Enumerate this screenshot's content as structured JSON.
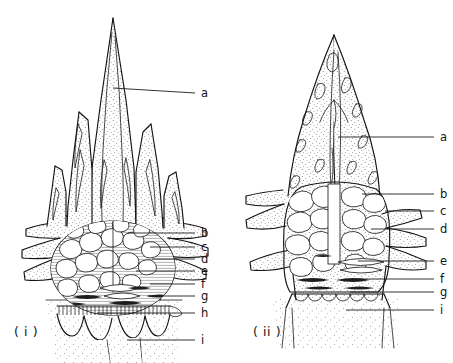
{
  "figure": {
    "background_color": "#ffffff",
    "ink_color": "#141414",
    "panels": [
      {
        "id": "panel-i",
        "caption": "( i )",
        "caption_x": 14,
        "caption_y": 336,
        "labels": [
          {
            "key": "a",
            "text": "a",
            "label_x": 201,
            "label_y": 93,
            "leader_x1": 113,
            "leader_y1": 88,
            "leader_x2": 195,
            "leader_y2": 93
          },
          {
            "key": "b",
            "text": "b",
            "label_x": 201,
            "label_y": 233,
            "leader_x1": 128,
            "leader_y1": 233,
            "leader_x2": 195,
            "leader_y2": 233
          },
          {
            "key": "c",
            "text": "c",
            "label_x": 201,
            "label_y": 247,
            "leader_x1": 150,
            "leader_y1": 247,
            "leader_x2": 195,
            "leader_y2": 247
          },
          {
            "key": "d",
            "text": "d",
            "label_x": 201,
            "label_y": 259,
            "leader_x1": 152,
            "leader_y1": 259,
            "leader_x2": 195,
            "leader_y2": 259
          },
          {
            "key": "e",
            "text": "e",
            "label_x": 201,
            "label_y": 271,
            "leader_x1": 136,
            "leader_y1": 271,
            "leader_x2": 195,
            "leader_y2": 271
          },
          {
            "key": "f",
            "text": "f",
            "label_x": 201,
            "label_y": 284,
            "leader_x1": 150,
            "leader_y1": 284,
            "leader_x2": 195,
            "leader_y2": 284
          },
          {
            "key": "g",
            "text": "g",
            "label_x": 201,
            "label_y": 296,
            "leader_x1": 148,
            "leader_y1": 296,
            "leader_x2": 195,
            "leader_y2": 296
          },
          {
            "key": "h",
            "text": "h",
            "label_x": 201,
            "label_y": 313,
            "leader_x1": 97,
            "leader_y1": 313,
            "leader_x2": 195,
            "leader_y2": 313
          },
          {
            "key": "i",
            "text": "i",
            "label_x": 201,
            "label_y": 340,
            "leader_x1": 127,
            "leader_y1": 340,
            "leader_x2": 195,
            "leader_y2": 340
          }
        ]
      },
      {
        "id": "panel-ii",
        "caption": "( ii )",
        "caption_x": 253,
        "caption_y": 336,
        "labels": [
          {
            "key": "a",
            "text": "a",
            "label_x": 440,
            "label_y": 137,
            "leader_x1": 338,
            "leader_y1": 137,
            "leader_x2": 434,
            "leader_y2": 137
          },
          {
            "key": "b",
            "text": "b",
            "label_x": 440,
            "label_y": 194,
            "leader_x1": 362,
            "leader_y1": 194,
            "leader_x2": 434,
            "leader_y2": 194
          },
          {
            "key": "c",
            "text": "c",
            "label_x": 440,
            "label_y": 211,
            "leader_x1": 385,
            "leader_y1": 211,
            "leader_x2": 434,
            "leader_y2": 211
          },
          {
            "key": "d",
            "text": "d",
            "label_x": 440,
            "label_y": 229,
            "leader_x1": 371,
            "leader_y1": 229,
            "leader_x2": 434,
            "leader_y2": 229
          },
          {
            "key": "e",
            "text": "e",
            "label_x": 440,
            "label_y": 261,
            "leader_x1": 358,
            "leader_y1": 261,
            "leader_x2": 434,
            "leader_y2": 261
          },
          {
            "key": "f",
            "text": "f",
            "label_x": 440,
            "label_y": 279,
            "leader_x1": 356,
            "leader_y1": 279,
            "leader_x2": 434,
            "leader_y2": 279
          },
          {
            "key": "g",
            "text": "g",
            "label_x": 440,
            "label_y": 292,
            "leader_x1": 350,
            "leader_y1": 292,
            "leader_x2": 434,
            "leader_y2": 292
          },
          {
            "key": "i",
            "text": "i",
            "label_x": 440,
            "label_y": 310,
            "leader_x1": 346,
            "leader_y1": 310,
            "leader_x2": 434,
            "leader_y2": 310
          }
        ]
      }
    ]
  }
}
